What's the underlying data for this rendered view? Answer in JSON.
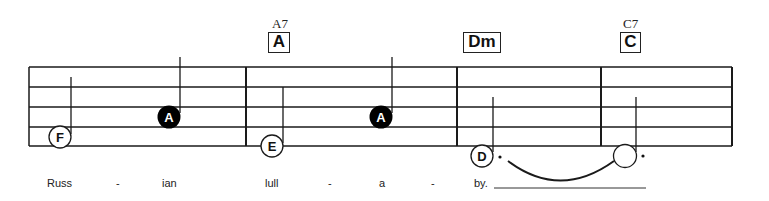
{
  "chords": [
    {
      "name": "A7",
      "symbol": "A"
    },
    {
      "name": "",
      "symbol": "Dm"
    },
    {
      "name": "C7",
      "symbol": "C"
    }
  ],
  "notes": [
    {
      "letter": "F",
      "filled": false
    },
    {
      "letter": "A",
      "filled": true
    },
    {
      "letter": "E",
      "filled": false
    },
    {
      "letter": "A",
      "filled": true
    },
    {
      "letter": "D",
      "filled": false,
      "dotted": true
    },
    {
      "letter": "",
      "filled": false,
      "dotted": true,
      "tied": true
    }
  ],
  "lyrics": [
    "Russ",
    "-",
    "ian",
    "lull",
    "-",
    "a",
    "-",
    "by."
  ],
  "colors": {
    "ink": "#111111",
    "filled_note": "#000000",
    "background": "#ffffff"
  }
}
